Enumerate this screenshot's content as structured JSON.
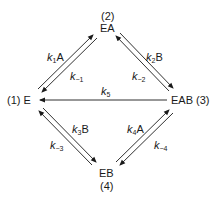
{
  "nodes": {
    "n2": {
      "num": "(2)",
      "label": "EA"
    },
    "n1": {
      "label": "(1) E"
    },
    "n3": {
      "label": "EAB (3)"
    },
    "n4": {
      "num": "(4)",
      "label": "EB"
    }
  },
  "rates": {
    "k1": {
      "k": "k",
      "sub": "1",
      "suffix": "A"
    },
    "km1": {
      "k": "k",
      "sub": "−1",
      "suffix": ""
    },
    "k2": {
      "k": "k",
      "sub": "2",
      "suffix": "B"
    },
    "km2": {
      "k": "k",
      "sub": "−2",
      "suffix": ""
    },
    "k5": {
      "k": "k",
      "sub": "5",
      "suffix": ""
    },
    "k3": {
      "k": "k",
      "sub": "3",
      "suffix": "B"
    },
    "km3": {
      "k": "k",
      "sub": "−3",
      "suffix": ""
    },
    "k4": {
      "k": "k",
      "sub": "4",
      "suffix": "A"
    },
    "km4": {
      "k": "k",
      "sub": "−4",
      "suffix": ""
    }
  },
  "colors": {
    "line": "#1a1a1a",
    "background": "#ffffff"
  }
}
